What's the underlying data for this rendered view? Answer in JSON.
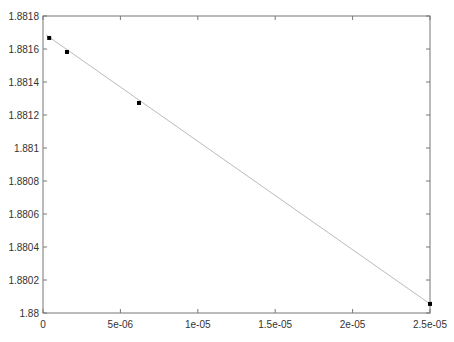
{
  "chart_data": {
    "type": "scatter",
    "title": "",
    "xlabel": "",
    "ylabel": "",
    "xlim": [
      0,
      2.5e-05
    ],
    "ylim": [
      1.88,
      1.8818
    ],
    "grid": false,
    "legend": null,
    "x_ticks": [
      0,
      5e-06,
      1e-05,
      1.5e-05,
      2e-05,
      2.5e-05
    ],
    "x_tick_labels": [
      "0",
      "5e-06",
      "1e-05",
      "1.5e-05",
      "2e-05",
      "2.5e-05"
    ],
    "y_ticks": [
      1.88,
      1.8802,
      1.8804,
      1.8806,
      1.8808,
      1.881,
      1.8812,
      1.8814,
      1.8816,
      1.8818
    ],
    "y_tick_labels": [
      "1.88",
      "1.8802",
      "1.8804",
      "1.8806",
      "1.8808",
      "1.881",
      "1.8812",
      "1.8814",
      "1.8816",
      "1.8818"
    ],
    "series": [
      {
        "name": "data points",
        "style": "markers",
        "color": "#000000",
        "x": [
          4e-07,
          1.55e-06,
          6.2e-06,
          2.5e-05
        ],
        "y": [
          1.881667,
          1.881582,
          1.881273,
          1.880055
        ]
      },
      {
        "name": "fit line",
        "style": "line",
        "color": "#bbbbbb",
        "x": [
          2e-07,
          2.5e-05
        ],
        "y": [
          1.881685,
          1.880055
        ]
      }
    ]
  },
  "colors": {
    "axis": "#777777",
    "marker": "#000000",
    "line": "#bbbbbb",
    "text": "#333333"
  }
}
